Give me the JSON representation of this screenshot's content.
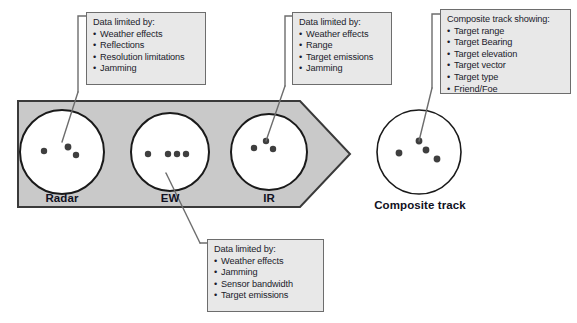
{
  "diagram": {
    "colors": {
      "arrow_fill": "#c9c9c9",
      "arrow_stroke": "#3a3a3a",
      "box_fill": "#e8e8e8",
      "box_stroke": "#6d6d6d",
      "circle_fill": "#ffffff",
      "circle_stroke": "#1a1a1a",
      "dot_fill": "#3f3f3f",
      "leader_stroke": "#6d6d6d",
      "label_color": "#111122"
    },
    "sensors": [
      {
        "id": "radar",
        "label": "Radar",
        "dots": [
          {
            "cx": 44,
            "cy": 151,
            "r": 3.2
          },
          {
            "cx": 68,
            "cy": 147,
            "r": 3.4
          },
          {
            "cx": 76,
            "cy": 155,
            "r": 3.2
          }
        ]
      },
      {
        "id": "ew",
        "label": "EW",
        "dots": [
          {
            "cx": 148,
            "cy": 154,
            "r": 3.2
          },
          {
            "cx": 168,
            "cy": 154,
            "r": 3.2
          },
          {
            "cx": 177,
            "cy": 154,
            "r": 3.2
          },
          {
            "cx": 186,
            "cy": 154,
            "r": 3.2
          }
        ]
      },
      {
        "id": "ir",
        "label": "IR",
        "dots": [
          {
            "cx": 254,
            "cy": 148,
            "r": 3.2
          },
          {
            "cx": 266,
            "cy": 141,
            "r": 3.2
          },
          {
            "cx": 273,
            "cy": 149,
            "r": 3.2
          }
        ]
      },
      {
        "id": "composite",
        "label": "Composite track",
        "dots": [
          {
            "cx": 399,
            "cy": 153,
            "r": 3.4
          },
          {
            "cx": 419,
            "cy": 141,
            "r": 3.4
          },
          {
            "cx": 426,
            "cy": 150,
            "r": 3.4
          },
          {
            "cx": 437,
            "cy": 159,
            "r": 3.4
          }
        ]
      }
    ],
    "callouts": [
      {
        "id": "radar-callout",
        "title": "Data limited by:",
        "items": [
          "Weather effects",
          "Reflections",
          "Resolution limitations",
          "Jamming"
        ]
      },
      {
        "id": "ir-callout",
        "title": "Data limited by:",
        "items": [
          "Weather effects",
          "Range",
          "Target emissions",
          "Jamming"
        ]
      },
      {
        "id": "composite-callout",
        "title": "Composite track showing:",
        "items": [
          "Target range",
          "Target Bearing",
          "Target elevation",
          "Target vector",
          "Target type",
          "Friend/Foe"
        ]
      },
      {
        "id": "ew-callout",
        "title": "Data limited by:",
        "items": [
          "Weather effects",
          "Jamming",
          "Sensor bandwidth",
          "Target emissions"
        ]
      }
    ]
  }
}
